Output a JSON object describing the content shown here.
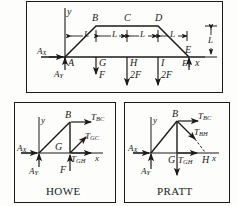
{
  "figure": {
    "kind": "truss-free-body-diagram",
    "line_color": "#1a1a1a",
    "background": "#fdfdfb"
  },
  "main_truss": {
    "name": "main-truss-panel",
    "axis": {
      "y_label": "y",
      "x_label": "x"
    },
    "reactions": [
      {
        "id": "AX",
        "base": "A",
        "sub": "X",
        "dir": "right"
      },
      {
        "id": "AY",
        "base": "A",
        "sub": "Y",
        "dir": "up"
      },
      {
        "id": "EY",
        "base": "E",
        "sub": "Y",
        "dir": "up"
      }
    ],
    "joints": [
      {
        "label": "A"
      },
      {
        "label": "B"
      },
      {
        "label": "C"
      },
      {
        "label": "D"
      },
      {
        "label": "E"
      },
      {
        "label": "G"
      },
      {
        "label": "H"
      },
      {
        "label": "I"
      }
    ],
    "loads": [
      {
        "at": "G",
        "magnitude": "F",
        "dir": "down"
      },
      {
        "at": "H",
        "magnitude": "2F",
        "dir": "down"
      },
      {
        "at": "I",
        "magnitude": "2F",
        "dir": "down"
      }
    ],
    "dimensions": [
      {
        "label": "L",
        "orient": "horizontal",
        "span": "A-G"
      },
      {
        "label": "L",
        "orient": "horizontal",
        "span": "G-H"
      },
      {
        "label": "L",
        "orient": "horizontal",
        "span": "H-I"
      },
      {
        "label": "L",
        "orient": "horizontal",
        "span": "I-E"
      },
      {
        "label": "L",
        "orient": "vertical",
        "span": "height"
      }
    ]
  },
  "howe": {
    "name": "howe-joint-panel",
    "caption": "HOWE",
    "axis": {
      "y_label": "y",
      "x_label": "x"
    },
    "reactions": [
      {
        "id": "AX",
        "base": "A",
        "sub": "X",
        "dir": "right"
      },
      {
        "id": "AY",
        "base": "A",
        "sub": "Y",
        "dir": "up"
      }
    ],
    "joints": [
      {
        "label": "B"
      },
      {
        "label": "G"
      }
    ],
    "loads": [
      {
        "at": "G",
        "magnitude": "F",
        "dir": "down"
      }
    ],
    "member_forces": [
      {
        "base": "T",
        "sub": "BC",
        "dir": "right"
      },
      {
        "base": "T",
        "sub": "GC",
        "dir": "up-right"
      },
      {
        "base": "T",
        "sub": "GH",
        "dir": "right"
      }
    ]
  },
  "pratt": {
    "name": "pratt-joint-panel",
    "caption": "PRATT",
    "axis": {
      "y_label": "y",
      "x_label": "x"
    },
    "reactions": [
      {
        "id": "AX",
        "base": "A",
        "sub": "X",
        "dir": "right"
      },
      {
        "id": "AY",
        "base": "A",
        "sub": "Y",
        "dir": "up"
      }
    ],
    "joints": [
      {
        "label": "B"
      },
      {
        "label": "G"
      },
      {
        "label": "H"
      }
    ],
    "member_forces": [
      {
        "base": "T",
        "sub": "BC",
        "dir": "right"
      },
      {
        "base": "T",
        "sub": "BH",
        "dir": "down-right"
      },
      {
        "base": "T",
        "sub": "GH",
        "dir": "right"
      }
    ]
  }
}
